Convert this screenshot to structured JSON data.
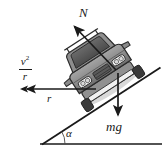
{
  "figure": {
    "background_color": "#ffffff",
    "width": 167,
    "height": 153,
    "ink_color": "#1a1a1a"
  },
  "labels": {
    "normal_force": "N",
    "weight": "mg",
    "radius": "r",
    "angle": "α",
    "centripetal_numerator": "v",
    "centripetal_exponent": "2",
    "centripetal_denominator": "r"
  },
  "vectors": [
    {
      "name": "normal-force-vector",
      "label": "N",
      "direction": "up-left",
      "from": [
        116,
        70
      ],
      "to": [
        72,
        24
      ],
      "color": "#1a1a1a"
    },
    {
      "name": "weight-vector",
      "label": "mg",
      "direction": "down",
      "from": [
        118,
        73
      ],
      "to": [
        118,
        119
      ],
      "color": "#1a1a1a"
    },
    {
      "name": "centripetal-acceleration-vector",
      "label": "r",
      "sublabel": "v^2/r",
      "direction": "left",
      "from": [
        96,
        89
      ],
      "to": [
        22,
        89
      ],
      "color": "#1a1a1a",
      "double_arrowhead": true
    }
  ],
  "geometry": {
    "incline_line": {
      "name": "incline-surface",
      "from": [
        42,
        144
      ],
      "to": [
        160,
        68
      ]
    },
    "ground_line": {
      "name": "ground-baseline",
      "from": [
        40,
        144
      ],
      "to": [
        162,
        144
      ]
    },
    "angle_arc": {
      "name": "incline-angle-arc",
      "vertex": [
        42,
        144
      ],
      "radius": 22,
      "label": "α"
    }
  },
  "vehicle": {
    "name": "car-illustration",
    "description": "grayscale SUV viewed from the front, tilted along the incline",
    "body_color": "#8c8c8c",
    "window_color": "#5a5a5a",
    "outline_color": "#2b2b2b",
    "headlight_color": "#f2f2f2",
    "tire_color": "#3a3a3a"
  }
}
